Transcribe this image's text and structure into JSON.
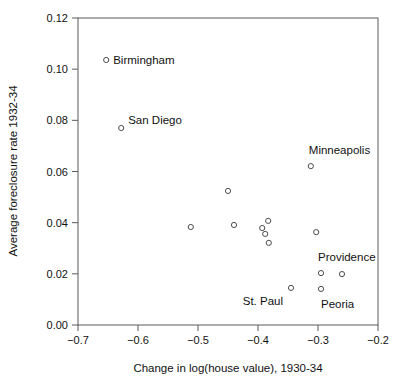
{
  "chart_data": {
    "type": "scatter",
    "title": "",
    "xlabel": "Change in log(house value), 1930-34",
    "ylabel": "Average foreclosure rate 1932-34",
    "xlim": [
      -0.7,
      -0.2
    ],
    "ylim": [
      0.0,
      0.12
    ],
    "xticks": [
      "-0.7",
      "-0.6",
      "-0.5",
      "-0.4",
      "-0.3",
      "-0.2"
    ],
    "xtick_values": [
      -0.7,
      -0.6,
      -0.5,
      -0.4,
      -0.3,
      -0.2
    ],
    "yticks": [
      "0.00",
      "0.02",
      "0.04",
      "0.06",
      "0.08",
      "0.10",
      "0.12"
    ],
    "ytick_values": [
      0.0,
      0.02,
      0.04,
      0.06,
      0.08,
      0.1,
      0.12
    ],
    "grid": false,
    "legend": false,
    "marker": "open-circle",
    "marker_color": "#4d4d4d",
    "points": [
      {
        "label": "Birmingham",
        "x": -0.653,
        "y": 0.1036,
        "label_dx": 7,
        "label_dy": 4
      },
      {
        "label": "San Diego",
        "x": -0.628,
        "y": 0.077,
        "label_dx": 7,
        "label_dy": -4
      },
      {
        "label": "Minneapolis",
        "x": -0.312,
        "y": 0.0621,
        "label_dx": -2,
        "label_dy": -12
      },
      {
        "label": "",
        "x": -0.45,
        "y": 0.0524,
        "label_dx": 0,
        "label_dy": 0
      },
      {
        "label": "",
        "x": -0.512,
        "y": 0.0383,
        "label_dx": 0,
        "label_dy": 0
      },
      {
        "label": "",
        "x": -0.44,
        "y": 0.0391,
        "label_dx": 0,
        "label_dy": 0
      },
      {
        "label": "",
        "x": -0.383,
        "y": 0.0407,
        "label_dx": 0,
        "label_dy": 0
      },
      {
        "label": "",
        "x": -0.393,
        "y": 0.0379,
        "label_dx": 0,
        "label_dy": 0
      },
      {
        "label": "",
        "x": -0.388,
        "y": 0.0356,
        "label_dx": 0,
        "label_dy": 0
      },
      {
        "label": "",
        "x": -0.382,
        "y": 0.0321,
        "label_dx": 0,
        "label_dy": 0
      },
      {
        "label": "",
        "x": -0.303,
        "y": 0.0363,
        "label_dx": 0,
        "label_dy": 0
      },
      {
        "label": "Providence",
        "x": -0.295,
        "y": 0.0203,
        "label_dx": -3,
        "label_dy": -12
      },
      {
        "label": "",
        "x": -0.26,
        "y": 0.0199,
        "label_dx": 0,
        "label_dy": 0
      },
      {
        "label": "St. Paul",
        "x": -0.345,
        "y": 0.0145,
        "label_dx": -8,
        "label_dy": 17,
        "label_anchor": "end"
      },
      {
        "label": "Peoria",
        "x": -0.295,
        "y": 0.0141,
        "label_dx": 0,
        "label_dy": 19
      }
    ]
  },
  "figure": {
    "plot_left_px": 78,
    "plot_right_px": 378,
    "plot_top_px": 18,
    "plot_bottom_px": 325,
    "background": "#ffffff",
    "axis_color": "#5a5a5a"
  }
}
